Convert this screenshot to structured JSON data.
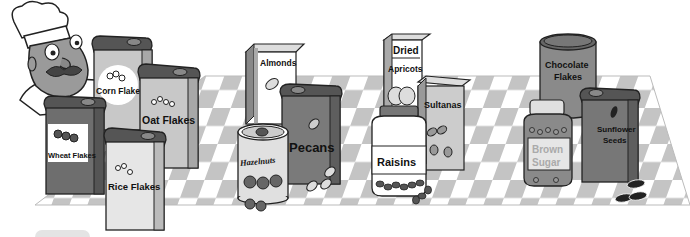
{
  "scene": {
    "description": "Grayscale illustration of a chef behind groups of food containers on a checkered tablecloth",
    "palette": {
      "outline": "#222222",
      "dark": "#6e6e6e",
      "mid": "#9a9a9a",
      "light": "#c8c8c8",
      "pale": "#e6e6e6",
      "white": "#ffffff",
      "check": "#c4c4c4"
    }
  },
  "groups": {
    "cereals": {
      "items": [
        {
          "label_line1": "Corn Flakes"
        },
        {
          "label_line1": "Oat Flakes"
        },
        {
          "label_line1": "Wheat Flakes"
        },
        {
          "label_line1": "Rice Flakes"
        }
      ]
    },
    "nuts": {
      "items": [
        {
          "label_line1": "Almonds"
        },
        {
          "label_line1": "Hazelnuts"
        },
        {
          "label_line1": "Pecans"
        }
      ]
    },
    "dried_fruit": {
      "items": [
        {
          "label_line1": "Dried",
          "label_line2": "Apricots"
        },
        {
          "label_line1": "Sultanas"
        },
        {
          "label_line1": "Raisins"
        }
      ]
    },
    "other": {
      "items": [
        {
          "label_line1": "Chocolate",
          "label_line2": "Flakes"
        },
        {
          "label_line1": "Brown",
          "label_line2": "Sugar"
        },
        {
          "label_line1": "Sunflower",
          "label_line2": "Seeds"
        }
      ]
    }
  }
}
